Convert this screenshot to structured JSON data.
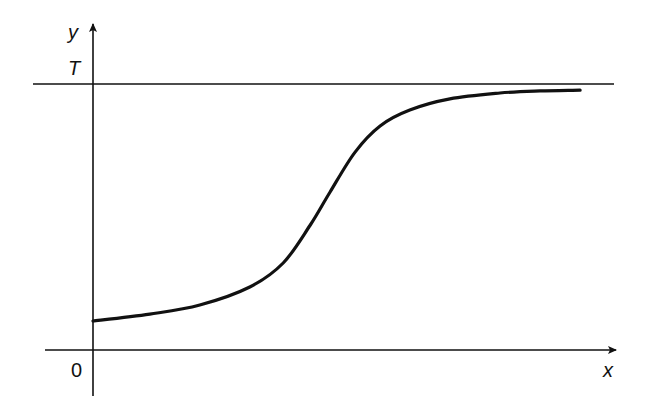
{
  "chart_data": {
    "type": "line",
    "title": "",
    "xlabel": "x",
    "ylabel": "y",
    "origin_label": "0",
    "asymptote_label": "T",
    "asymptote_value": 1.0,
    "xlim": [
      0,
      1
    ],
    "ylim": [
      0,
      1
    ],
    "grid": false,
    "legend": "none",
    "series": [
      {
        "name": "logistic curve",
        "x": [
          0.0,
          0.109,
          0.205,
          0.301,
          0.365,
          0.417,
          0.455,
          0.503,
          0.551,
          0.608,
          0.685,
          0.781,
          0.858,
          0.935
        ],
        "y": [
          0.109,
          0.135,
          0.169,
          0.237,
          0.327,
          0.47,
          0.594,
          0.744,
          0.842,
          0.902,
          0.944,
          0.966,
          0.974,
          0.977
        ]
      }
    ]
  }
}
